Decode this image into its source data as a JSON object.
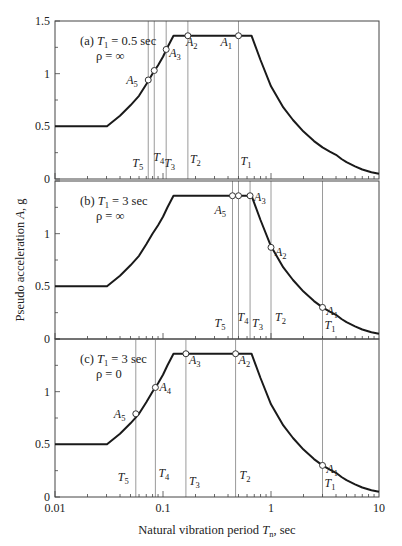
{
  "chart_data": {
    "type": "line",
    "xscale": "log",
    "xlim": [
      0.01,
      10
    ],
    "ylim": [
      0,
      1.5
    ],
    "xlabel": "Natural vibration period T_n, sec",
    "xlabel_parts": {
      "main": "Natural vibration period ",
      "var": "T",
      "sub": "n",
      "unit": ", sec"
    },
    "ylabel": "Pseudo acceleration A, g",
    "ylabel_parts": {
      "main": "Pseudo acceleration ",
      "var": "A",
      "unit": ", g"
    },
    "x_ticks": [
      0.01,
      0.1,
      1,
      10
    ],
    "x_tick_labels": [
      "0.01",
      "0.1",
      "1",
      "10"
    ],
    "y_ticks": [
      0,
      0.5,
      1,
      1.5
    ],
    "y_tick_labels": [
      "0",
      "0.5",
      "1",
      "1.5"
    ],
    "grid": false,
    "spectrum": {
      "name": "Design spectrum",
      "points": [
        [
          0.01,
          0.5
        ],
        [
          0.0303,
          0.5
        ],
        [
          0.04,
          0.6
        ],
        [
          0.05,
          0.7
        ],
        [
          0.06,
          0.79
        ],
        [
          0.07,
          0.9
        ],
        [
          0.08,
          1.0
        ],
        [
          0.09,
          1.08
        ],
        [
          0.1,
          1.16
        ],
        [
          0.11,
          1.25
        ],
        [
          0.125,
          1.36
        ],
        [
          0.66,
          1.36
        ],
        [
          0.8,
          1.13
        ],
        [
          1.0,
          0.88
        ],
        [
          1.3,
          0.68
        ],
        [
          1.6,
          0.56
        ],
        [
          2.0,
          0.45
        ],
        [
          2.5,
          0.36
        ],
        [
          3.0,
          0.3
        ],
        [
          3.5,
          0.26
        ],
        [
          4.0,
          0.23
        ],
        [
          4.5,
          0.19
        ],
        [
          5.0,
          0.16
        ],
        [
          6.0,
          0.12
        ],
        [
          7.0,
          0.09
        ],
        [
          8.5,
          0.065
        ],
        [
          10,
          0.05
        ]
      ]
    },
    "panels": [
      {
        "label": "(a)",
        "t1_text": "T",
        "t1_sub": "1",
        "t1_value": " = 0.5 sec",
        "rho_text": "ρ = ∞",
        "modes": [
          {
            "T_label": "T",
            "sub": "1",
            "A_label": "A",
            "T": 0.5,
            "A": 1.36
          },
          {
            "T_label": "T",
            "sub": "2",
            "A_label": "A",
            "T": 0.17,
            "A": 1.36
          },
          {
            "T_label": "T",
            "sub": "3",
            "A_label": "A",
            "T": 0.107,
            "A": 1.23
          },
          {
            "T_label": "T",
            "sub": "4",
            "A_label": "A",
            "T": 0.083,
            "A": 1.03
          },
          {
            "T_label": "T",
            "sub": "5",
            "A_label": "A",
            "T": 0.073,
            "A": 0.94
          }
        ]
      },
      {
        "label": "(b)",
        "t1_text": "T",
        "t1_sub": "1",
        "t1_value": " = 3 sec",
        "rho_text": "ρ = ∞",
        "modes": [
          {
            "T_label": "T",
            "sub": "1",
            "A_label": "A",
            "T": 3.0,
            "A": 0.3
          },
          {
            "T_label": "T",
            "sub": "2",
            "A_label": "A",
            "T": 1.0,
            "A": 0.87
          },
          {
            "T_label": "T",
            "sub": "3",
            "A_label": "A",
            "T": 0.64,
            "A": 1.36
          },
          {
            "T_label": "T",
            "sub": "4",
            "A_label": "A",
            "T": 0.5,
            "A": 1.36
          },
          {
            "T_label": "T",
            "sub": "5",
            "A_label": "A",
            "T": 0.44,
            "A": 1.36
          }
        ]
      },
      {
        "label": "(c)",
        "t1_text": "T",
        "t1_sub": "1",
        "t1_value": " = 3 sec",
        "rho_text": "ρ = 0",
        "modes": [
          {
            "T_label": "T",
            "sub": "1",
            "A_label": "A",
            "T": 3.0,
            "A": 0.3
          },
          {
            "T_label": "T",
            "sub": "2",
            "A_label": "A",
            "T": 0.47,
            "A": 1.36
          },
          {
            "T_label": "T",
            "sub": "3",
            "A_label": "A",
            "T": 0.163,
            "A": 1.36
          },
          {
            "T_label": "T",
            "sub": "4",
            "A_label": "A",
            "T": 0.085,
            "A": 1.04
          },
          {
            "T_label": "T",
            "sub": "5",
            "A_label": "A",
            "T": 0.056,
            "A": 0.79
          }
        ]
      }
    ]
  }
}
